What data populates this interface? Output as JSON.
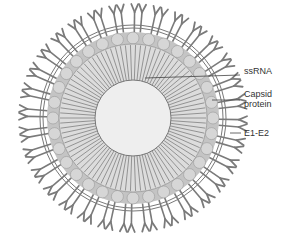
{
  "diagram": {
    "type": "virus cross-section",
    "center": [
      133,
      118
    ],
    "radii": {
      "core": 38,
      "rna_outer": 74,
      "capsid_outer": 86,
      "membrane": 92,
      "spikes_tip": 114
    },
    "colors": {
      "spike": "#7a7a7a",
      "capsid": "#b8b8b8",
      "rna": "#8a8a8a",
      "core": "#eeeeee",
      "membrane": "#555555",
      "leader": "#444444"
    },
    "labels": [
      {
        "id": "ssrna",
        "text": "ssRNA",
        "x": 244,
        "y": 70,
        "line_from": [
          145,
          78
        ],
        "line_to": [
          240,
          75
        ]
      },
      {
        "id": "capsid",
        "text": "Capsid",
        "text2": "protein",
        "x": 244,
        "y": 92,
        "line_from": [
          212,
          100
        ],
        "line_to": [
          240,
          100
        ]
      },
      {
        "id": "e1e2",
        "text": "E1-E2",
        "x": 244,
        "y": 128,
        "line_from": [
          230,
          133
        ],
        "line_to": [
          241,
          133
        ]
      }
    ]
  }
}
